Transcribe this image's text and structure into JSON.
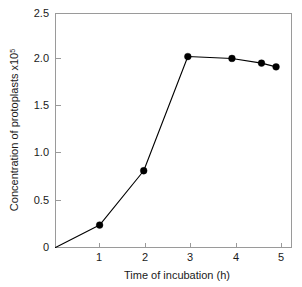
{
  "chart_data": {
    "type": "line",
    "title": "",
    "subtitle": "",
    "xlabel": "Time of incubation (h)",
    "ylabel": "Concentration of protoplasts x10",
    "ylabel_base": "Concentration of protoplasts x10",
    "ylabel_exponent": "5",
    "ylabel_full": "Concentration of protoplasts x10⁵",
    "xlim": [
      0,
      5.35
    ],
    "ylim": [
      0,
      2.5
    ],
    "xticks": [
      1,
      2,
      3,
      4,
      5
    ],
    "xtick_labels": [
      "1",
      "2",
      "3",
      "4",
      "5"
    ],
    "yticks": [
      0,
      0.5,
      1.0,
      1.5,
      2.0,
      2.5
    ],
    "ytick_labels": [
      "0",
      "0.5",
      "1.0",
      "1.5",
      "2.0",
      "2.5"
    ],
    "grid": false,
    "legend": false,
    "legend_position": "none",
    "marker": "filled-circle",
    "line_color": "#000000",
    "marker_color": "#000000",
    "axis_color": "#9a9a9a",
    "background_color": "#ffffff",
    "series": [
      {
        "name": "Protoplast concentration",
        "x": [
          0,
          1,
          2,
          3,
          4,
          4.67,
          5
        ],
        "y": [
          0,
          0.24,
          0.82,
          2.04,
          2.02,
          1.97,
          1.93
        ],
        "markers": [
          false,
          true,
          true,
          true,
          true,
          true,
          true
        ]
      }
    ],
    "points": [
      {
        "x": 0,
        "y": 0,
        "marker": false
      },
      {
        "x": 1,
        "y": 0.24,
        "marker": true
      },
      {
        "x": 2,
        "y": 0.82,
        "marker": true
      },
      {
        "x": 3,
        "y": 2.04,
        "marker": true
      },
      {
        "x": 4,
        "y": 2.02,
        "marker": true
      },
      {
        "x": 4.67,
        "y": 1.97,
        "marker": true
      },
      {
        "x": 5,
        "y": 1.93,
        "marker": true
      }
    ],
    "annotations": []
  }
}
